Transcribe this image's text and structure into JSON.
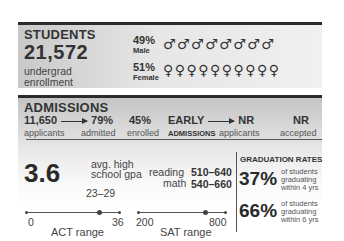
{
  "students": {
    "header": "STUDENTS",
    "enrollment": "21,572",
    "enrollment_label_1": "undergrad",
    "enrollment_label_2": "enrollment",
    "male": {
      "pct": "49%",
      "label": "Male",
      "symbols": "♂♂♂♂♂♂♂♂",
      "symbol_icon": "male-symbol-icon",
      "count": 8
    },
    "female": {
      "pct": "51%",
      "label": "Female",
      "symbols": "♀♀♀♀♀♀♀♀♀♀",
      "symbol_icon": "female-symbol-icon",
      "count": 10
    }
  },
  "admissions": {
    "header": "ADMISSIONS",
    "applicants": {
      "value": "11,650",
      "label": "applicants"
    },
    "admitted": {
      "value": "79%",
      "label": "admitted"
    },
    "enrolled": {
      "value": "45%",
      "label": "enrolled"
    },
    "early": {
      "value": "EARLY",
      "label": "ADMISSIONS"
    },
    "early_applicants": {
      "value": "NR",
      "label": "applicants"
    },
    "early_accepted": {
      "value": "NR",
      "label": "accepted"
    }
  },
  "academics": {
    "gpa": "3.6",
    "gpa_label_1": "avg. high",
    "gpa_label_2": "school gpa",
    "act_range_value": "23–29",
    "act": {
      "min": "0",
      "max": "36",
      "label": "ACT range"
    },
    "sat": {
      "reading_label": "reading",
      "reading_value": "510–640",
      "math_label": "math",
      "math_value": "540–660",
      "min": "200",
      "max": "800",
      "label": "SAT range"
    }
  },
  "graduation": {
    "header": "GRADUATION RATES",
    "rates": [
      {
        "pct": "37%",
        "line1": "of students",
        "line2": "graduating",
        "line3": "within 4 yrs"
      },
      {
        "pct": "66%",
        "line1": "of students",
        "line2": "graduating",
        "line3": "within 6 yrs"
      }
    ]
  }
}
